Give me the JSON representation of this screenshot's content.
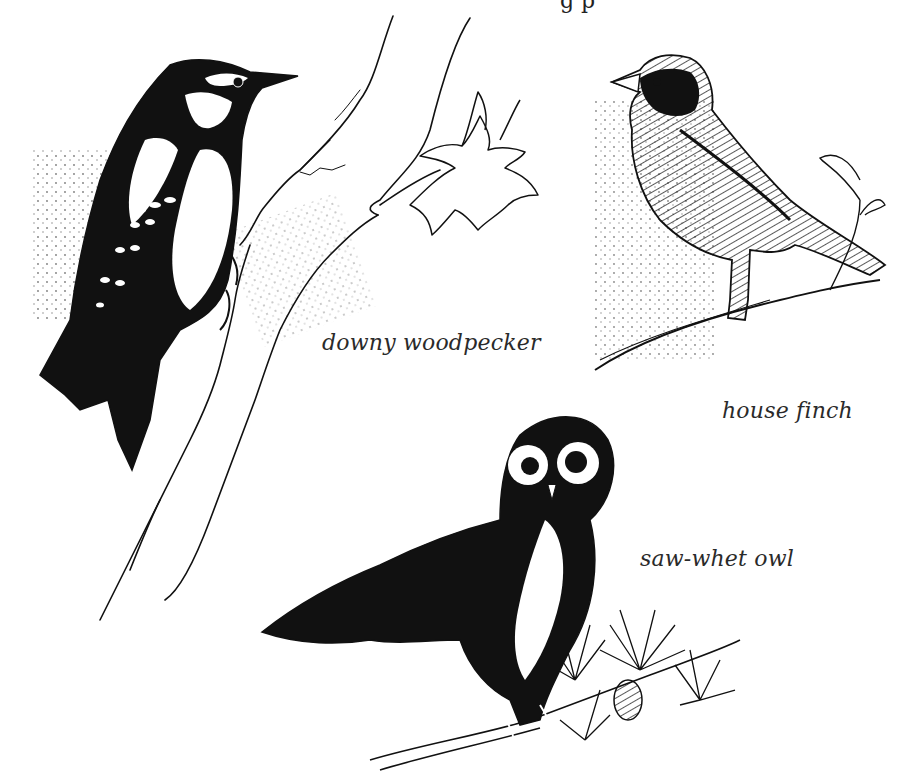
{
  "illustration": {
    "style": "pen-and-ink",
    "ink_color": "#111111",
    "paper_color": "#ffffff",
    "top_text_fragment": "g p",
    "birds": [
      {
        "id": "woodpecker",
        "caption": "downy woodpecker"
      },
      {
        "id": "finch",
        "caption": "house finch"
      },
      {
        "id": "owl",
        "caption": "saw-whet owl"
      }
    ]
  }
}
